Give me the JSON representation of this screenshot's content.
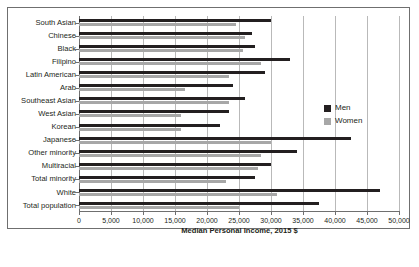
{
  "chart_data": {
    "type": "bar",
    "orientation": "horizontal",
    "title": "",
    "xlabel": "Median Personal Income, 2015 $",
    "ylabel": "",
    "xlim": [
      0,
      50000
    ],
    "xticks": [
      0,
      5000,
      10000,
      15000,
      20000,
      25000,
      30000,
      35000,
      40000,
      45000,
      50000
    ],
    "xtick_labels": [
      "0",
      "5,000",
      "10,000",
      "15,000",
      "20,000",
      "25,000",
      "30,000",
      "35,000",
      "40,000",
      "45,000",
      "50,000"
    ],
    "grid": true,
    "grid_axis": "x",
    "legend_position": "right",
    "categories": [
      "South Asian",
      "Chinese",
      "Black",
      "Filipino",
      "Latin American",
      "Arab",
      "Southeast Asian",
      "West Asian",
      "Korean",
      "Japanese",
      "Other minority",
      "Multiracial",
      "Total minority",
      "White",
      "Total population"
    ],
    "series": [
      {
        "name": "Men",
        "color": "#231f20",
        "values": [
          30000,
          27000,
          27500,
          33000,
          29000,
          24000,
          26000,
          23500,
          22000,
          42500,
          34000,
          30000,
          27500,
          47000,
          37500
        ]
      },
      {
        "name": "Women",
        "color": "#a7a7a7",
        "values": [
          24500,
          26000,
          25700,
          28500,
          23500,
          16500,
          23500,
          16000,
          16000,
          30000,
          28500,
          28000,
          23000,
          31000,
          25000
        ]
      }
    ]
  },
  "legend": {
    "items": [
      {
        "label": "Men",
        "color": "#231f20"
      },
      {
        "label": "Women",
        "color": "#a7a7a7"
      }
    ]
  },
  "colors": {
    "men": "#231f20",
    "women": "#a7a7a7",
    "grid": "#b9b9b9",
    "axis": "#6f6f6f",
    "frame": "#6f6f6f",
    "background": "#ffffff"
  }
}
